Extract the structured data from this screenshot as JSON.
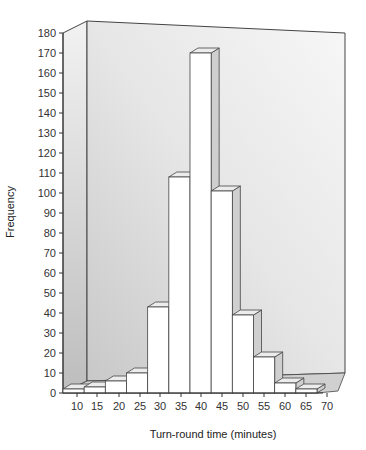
{
  "chart_data": {
    "type": "bar",
    "subtype": "histogram-3d",
    "title": "",
    "xlabel": "Turn-round time (minutes)",
    "ylabel": "Frequency",
    "x_ticks": [
      10,
      15,
      20,
      25,
      30,
      35,
      40,
      45,
      50,
      55,
      60,
      65,
      70
    ],
    "y_ticks": [
      0,
      10,
      20,
      30,
      40,
      50,
      60,
      70,
      80,
      90,
      100,
      110,
      120,
      130,
      140,
      150,
      160,
      170,
      180
    ],
    "ylim": [
      0,
      180
    ],
    "categories": [
      "10-15",
      "15-20",
      "20-25",
      "25-30",
      "30-35",
      "35-40",
      "40-45",
      "45-50",
      "50-55",
      "55-60",
      "60-65",
      "65-70"
    ],
    "bin_edges": [
      10,
      15,
      20,
      25,
      30,
      35,
      40,
      45,
      50,
      55,
      60,
      65,
      70
    ],
    "values": [
      2,
      3,
      6,
      10,
      43,
      108,
      170,
      101,
      39,
      18,
      5,
      2
    ],
    "grid": false,
    "legend": null,
    "colors": {
      "bar_front": "#ffffff",
      "bar_side": "#cfcfcf",
      "bar_top": "#ececec",
      "back_wall": "#eeeeee",
      "side_wall": "#d8d8d8",
      "edge": "#444444"
    }
  }
}
